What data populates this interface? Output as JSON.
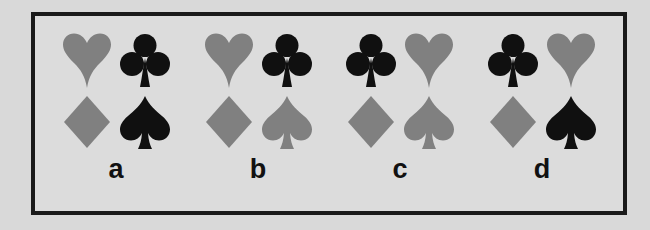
{
  "figure": {
    "background_color": "#d9d9d9",
    "panel_background_color": "#dcdcdc",
    "panel_border_color": "#1a1a1a"
  },
  "colors": {
    "black": "#101010",
    "gray": "#808080"
  },
  "groups": [
    {
      "label": "a",
      "suits": [
        {
          "name": "heart",
          "color": "#808080",
          "position": "top-left"
        },
        {
          "name": "club",
          "color": "#101010",
          "position": "top-right"
        },
        {
          "name": "diamond",
          "color": "#808080",
          "position": "bottom-left"
        },
        {
          "name": "spade",
          "color": "#101010",
          "position": "bottom-right"
        }
      ]
    },
    {
      "label": "b",
      "suits": [
        {
          "name": "heart",
          "color": "#808080",
          "position": "top-left"
        },
        {
          "name": "club",
          "color": "#101010",
          "position": "top-right"
        },
        {
          "name": "diamond",
          "color": "#808080",
          "position": "bottom-left"
        },
        {
          "name": "spade",
          "color": "#808080",
          "position": "bottom-right"
        }
      ]
    },
    {
      "label": "c",
      "suits": [
        {
          "name": "club",
          "color": "#101010",
          "position": "top-left"
        },
        {
          "name": "heart",
          "color": "#808080",
          "position": "top-right"
        },
        {
          "name": "diamond",
          "color": "#808080",
          "position": "bottom-left"
        },
        {
          "name": "spade",
          "color": "#808080",
          "position": "bottom-right"
        }
      ]
    },
    {
      "label": "d",
      "suits": [
        {
          "name": "club",
          "color": "#101010",
          "position": "top-left"
        },
        {
          "name": "heart",
          "color": "#808080",
          "position": "top-right"
        },
        {
          "name": "diamond",
          "color": "#808080",
          "position": "bottom-left"
        },
        {
          "name": "spade",
          "color": "#101010",
          "position": "bottom-right"
        }
      ]
    }
  ]
}
